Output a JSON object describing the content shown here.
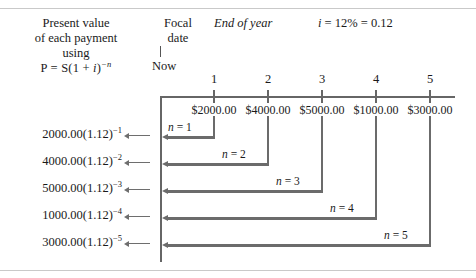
{
  "header": {
    "present_value_lines": [
      "Present value",
      "of each payment",
      "using"
    ],
    "present_value_formula_prefix": "P = S(1 + ",
    "present_value_formula_i": "i",
    "present_value_formula_mid": ")",
    "present_value_formula_exp": "−n",
    "focal_lines": [
      "Focal",
      "date"
    ],
    "end_of_year": "End of year",
    "rate_i": "i",
    "rate_rest": " = 12% = 0.12",
    "now_label": "Now"
  },
  "timeline": {
    "tick_labels": [
      "1",
      "2",
      "3",
      "4",
      "5"
    ],
    "payments": [
      "$2000.00",
      "$4000.00",
      "$5000.00",
      "$1000.00",
      "$3000.00"
    ]
  },
  "rows": [
    {
      "present_value": "2000.00(1.12)",
      "exponent": "−1",
      "n_label_var": "n",
      "n_label_rest": " = 1"
    },
    {
      "present_value": "4000.00(1.12)",
      "exponent": "−2",
      "n_label_var": "n",
      "n_label_rest": " = 2"
    },
    {
      "present_value": "5000.00(1.12)",
      "exponent": "−3",
      "n_label_var": "n",
      "n_label_rest": " = 3"
    },
    {
      "present_value": "1000.00(1.12)",
      "exponent": "−4",
      "n_label_var": "n",
      "n_label_rest": " = 4"
    },
    {
      "present_value": "3000.00(1.12)",
      "exponent": "−5",
      "n_label_var": "n",
      "n_label_rest": " = 5"
    }
  ],
  "colors": {
    "line": "#6b6b6b",
    "rule": "#c9c9c9",
    "text": "#1a1a1a"
  }
}
